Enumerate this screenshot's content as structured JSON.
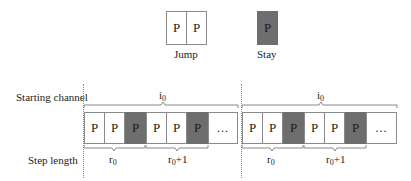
{
  "legend": {
    "jump": {
      "label": "Jump",
      "cells": [
        "P",
        "P"
      ]
    },
    "stay": {
      "label": "Stay",
      "cells": [
        "P"
      ]
    }
  },
  "row_labels": {
    "starting_channel": "Starting channel",
    "step_length": "Step length"
  },
  "groups": [
    {
      "top_brace_label": "i",
      "top_brace_sub": "0",
      "cells": [
        {
          "text": "P",
          "type": "jump"
        },
        {
          "text": "P",
          "type": "jump"
        },
        {
          "text": "P",
          "type": "stay"
        },
        {
          "text": "P",
          "type": "jump"
        },
        {
          "text": "P",
          "type": "jump"
        },
        {
          "text": "P",
          "type": "stay"
        },
        {
          "text": "...",
          "type": "ellipsis"
        }
      ],
      "bottom_braces": [
        {
          "label": "r",
          "sub": "0",
          "suffix": ""
        },
        {
          "label": "r",
          "sub": "0",
          "suffix": "+1"
        }
      ]
    },
    {
      "top_brace_label": "i",
      "top_brace_sub": "0",
      "cells": [
        {
          "text": "P",
          "type": "jump"
        },
        {
          "text": "P",
          "type": "jump"
        },
        {
          "text": "P",
          "type": "stay"
        },
        {
          "text": "P",
          "type": "jump"
        },
        {
          "text": "P",
          "type": "jump"
        },
        {
          "text": "P",
          "type": "stay"
        },
        {
          "text": "...",
          "type": "ellipsis"
        }
      ],
      "bottom_braces": [
        {
          "label": "r",
          "sub": "0",
          "suffix": ""
        },
        {
          "label": "r",
          "sub": "0",
          "suffix": "+1"
        }
      ]
    }
  ],
  "colors": {
    "stay_fill": "#6e6e6e",
    "border": "#8a8a8a"
  }
}
